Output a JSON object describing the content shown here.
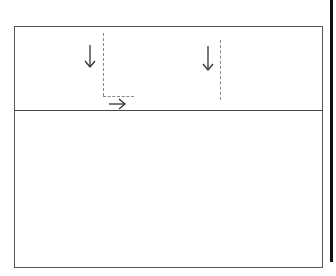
{
  "diagram": {
    "panels": [
      {
        "id": "top-panel",
        "label": ""
      },
      {
        "id": "bottom-panel",
        "label": ""
      }
    ],
    "arrows": [
      {
        "id": "arrow-down-1",
        "direction": "down",
        "icon": "arrow-down-icon"
      },
      {
        "id": "arrow-right-1",
        "direction": "right",
        "icon": "arrow-right-icon"
      },
      {
        "id": "arrow-down-2",
        "direction": "down",
        "icon": "arrow-down-icon"
      }
    ],
    "guides": [
      {
        "id": "guide-vertical-1",
        "style": "dashed"
      },
      {
        "id": "guide-horizontal-1",
        "style": "dashed"
      },
      {
        "id": "guide-vertical-2",
        "style": "dashed"
      }
    ],
    "colors": {
      "stroke": "#333333",
      "guide": "#888888",
      "edge_bar": "#111111",
      "background": "#ffffff"
    }
  }
}
